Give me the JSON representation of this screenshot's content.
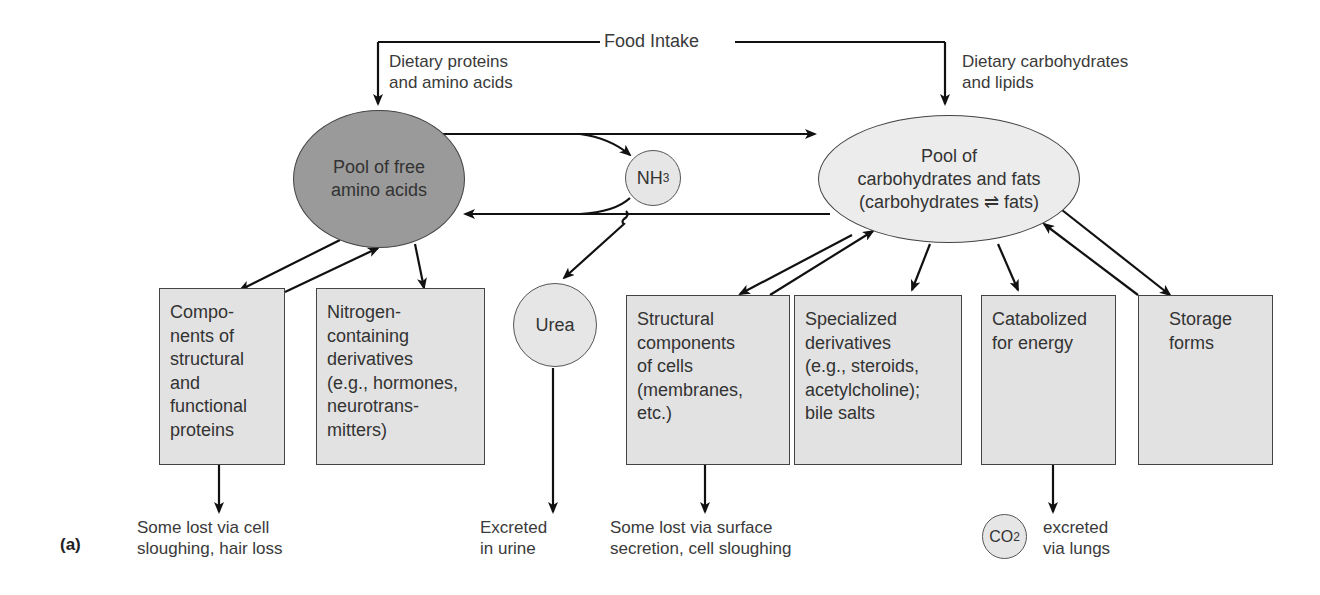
{
  "header": {
    "food_intake": "Food Intake",
    "dietary_proteins": [
      "Dietary proteins",
      "and amino acids"
    ],
    "dietary_carbs": [
      "Dietary carbohydrates",
      "and lipids"
    ]
  },
  "pools": {
    "amino_acids": [
      "Pool of free",
      "amino acids"
    ],
    "carbs_fats": [
      "Pool of",
      "carbohydrates and fats",
      "(carbohydrates ⇌ fats)"
    ]
  },
  "intermediates": {
    "nh3": {
      "base": "NH",
      "sub": "3"
    },
    "urea": "Urea",
    "co2": {
      "base": "CO",
      "sub": "2"
    }
  },
  "boxes": [
    {
      "id": "components-proteins",
      "lines": [
        "Compo-",
        "nents of",
        "structural",
        "and",
        "functional",
        "proteins"
      ]
    },
    {
      "id": "nitrogen-derivatives",
      "lines": [
        "Nitrogen-",
        "containing",
        "derivatives",
        "(e.g., hormones,",
        "neurotrans-",
        "mitters)"
      ]
    },
    {
      "id": "structural-cells",
      "lines": [
        "Structural",
        "components",
        "of cells",
        "(membranes,",
        "etc.)"
      ]
    },
    {
      "id": "specialized-derivatives",
      "lines": [
        "Specialized",
        "derivatives",
        "(e.g., steroids,",
        "acetylcholine);",
        "bile salts"
      ]
    },
    {
      "id": "catabolized-energy",
      "lines": [
        "Catabolized",
        "for energy"
      ]
    },
    {
      "id": "storage-forms",
      "lines": [
        "Storage",
        "forms"
      ]
    }
  ],
  "outcomes": {
    "hair_loss": [
      "Some lost via cell",
      "sloughing, hair loss"
    ],
    "urine": [
      "Excreted",
      "in urine"
    ],
    "surface": [
      "Some lost via surface",
      "secretion, cell sloughing"
    ],
    "lungs": [
      "excreted",
      "via lungs"
    ]
  },
  "panel_label": "(a)",
  "colors": {
    "amino_pool_fill": "#9a9a9a",
    "carb_pool_fill": "#ececec",
    "box_fill": "#e2e2e2",
    "stroke": "#111111"
  }
}
